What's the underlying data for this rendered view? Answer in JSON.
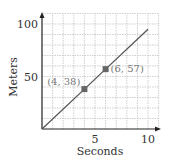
{
  "chart_data": {
    "type": "line",
    "title": "",
    "xlabel": "Seconds",
    "ylabel": "Meters",
    "xlim": [
      0,
      11
    ],
    "ylim": [
      0,
      110
    ],
    "grid": true,
    "x_ticks": [
      5,
      10
    ],
    "y_ticks": [
      50,
      100
    ],
    "x_tick_labels": [
      "5",
      "10"
    ],
    "y_tick_labels": [
      "50",
      "100"
    ],
    "series": [
      {
        "name": "distance",
        "x": [
          0,
          4,
          6,
          10
        ],
        "y": [
          0,
          38,
          57,
          95
        ]
      }
    ],
    "points": [
      {
        "x": 4,
        "y": 38,
        "label": "(4, 38)"
      },
      {
        "x": 6,
        "y": 57,
        "label": "(6, 57)"
      }
    ],
    "line_color": "#555555",
    "point_color": "#666666",
    "grid_color": "#bbbbbb"
  }
}
